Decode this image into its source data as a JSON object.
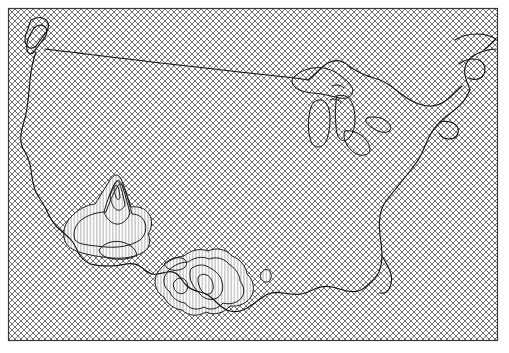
{
  "figure": {
    "type": "map",
    "title": "",
    "subtitle": "",
    "region_label": "Contiguous United States",
    "projection_label": "",
    "background_color": "#ffffff",
    "frame": {
      "label": "map-frame",
      "color": "#3a3a3a",
      "line_width": 1.2,
      "x": 8,
      "y": 8,
      "width": 489,
      "height": 332
    }
  },
  "layers": {
    "mask": {
      "label": "Masked / no-data region",
      "pattern": "diagonal-crosshatch",
      "color": "#5a5a5a",
      "line_width": 0.55,
      "spacing": 6,
      "coverage_description": "entire map extent except the contoured area"
    },
    "contours": {
      "label": "Contour lines",
      "color": "#1a1a1a",
      "fill_pattern": "vertical-hatch",
      "fill_pattern_color": "#8a8a8a",
      "fill_pattern_spacing": 3.2,
      "levels_visible": 5,
      "region_description": "Southwest United States and Texas / Mexico border"
    },
    "coastline": {
      "label": "Coastline and national borders",
      "color": "#111111",
      "line_width": 1.1
    },
    "lakes": {
      "label": "Great Lakes",
      "color": "#111111",
      "line_width": 1.0,
      "names": [
        "Superior",
        "Michigan",
        "Huron",
        "Erie",
        "Ontario"
      ]
    }
  },
  "chart_data": {
    "type": "map",
    "title": "",
    "xlabel": "",
    "ylabel": "",
    "grid": false,
    "legend": "none",
    "annotations": [],
    "contour_levels": [
      1,
      2,
      3,
      4,
      5
    ],
    "features": [
      {
        "name": "us-coastline",
        "kind": "polyline"
      },
      {
        "name": "canada-border",
        "kind": "polyline"
      },
      {
        "name": "mexico-border",
        "kind": "polyline"
      },
      {
        "name": "great-lakes",
        "kind": "polygon-set"
      },
      {
        "name": "contour-field-southwest",
        "kind": "contour-set"
      },
      {
        "name": "contour-field-texas",
        "kind": "contour-set"
      }
    ]
  }
}
